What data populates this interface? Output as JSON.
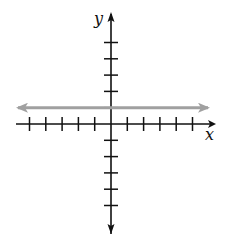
{
  "chart_data": {
    "type": "line",
    "title": "",
    "xlabel": "x",
    "ylabel": "y",
    "xlim": [
      -5,
      5
    ],
    "ylim": [
      -5,
      5
    ],
    "x_ticks": [
      -5,
      -4,
      -3,
      -2,
      -1,
      1,
      2,
      3,
      4,
      5
    ],
    "y_ticks": [
      -5,
      -4,
      -3,
      -2,
      -1,
      1,
      2,
      3,
      4,
      5
    ],
    "tick_labels_shown": false,
    "grid": false,
    "legend": null,
    "series": [
      {
        "name": "y = 1",
        "equation": "y = 1",
        "x": [
          -5.8,
          6
        ],
        "y": [
          1,
          1
        ],
        "color": "#a0a0a0",
        "arrows_both_ends": true
      }
    ]
  },
  "colors": {
    "axis": "#111111",
    "line": "#a0a0a0",
    "background": "#ffffff"
  }
}
